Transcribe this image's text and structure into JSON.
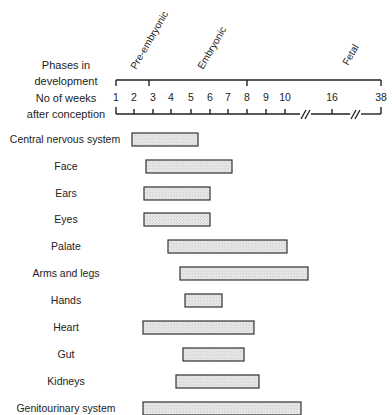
{
  "chart_data": {
    "type": "bar",
    "subtype": "gantt-timeline",
    "title": "",
    "phase_axis_label": [
      "Phases in",
      "development"
    ],
    "week_axis_label": [
      "No of weeks",
      "after conception"
    ],
    "phases": [
      {
        "name": "Pre-embryonic",
        "start": 1,
        "end": 2.8
      },
      {
        "name": "Embryonic",
        "start": 2.8,
        "end": 8
      },
      {
        "name": "Fetal",
        "start": 8,
        "end": 38
      }
    ],
    "week_ticks": [
      {
        "label": "1",
        "x": 116
      },
      {
        "label": "2",
        "x": 134
      },
      {
        "label": "3",
        "x": 153
      },
      {
        "label": "4",
        "x": 171
      },
      {
        "label": "5",
        "x": 191
      },
      {
        "label": "6",
        "x": 210
      },
      {
        "label": "7",
        "x": 228
      },
      {
        "label": "8",
        "x": 247
      },
      {
        "label": "9",
        "x": 266
      },
      {
        "label": "10",
        "x": 285
      },
      {
        "label": "16",
        "x": 332
      },
      {
        "label": "38",
        "x": 381
      }
    ],
    "axis_breaks": [
      "between 10 and 16",
      "between 16 and 38"
    ],
    "categories": [
      "Central nervous system",
      "Face",
      "Ears",
      "Eyes",
      "Palate",
      "Arms and legs",
      "Hands",
      "Heart",
      "Gut",
      "Kidneys",
      "Genitourinary system"
    ],
    "series": [
      {
        "name": "Critical period (weeks)",
        "ranges": [
          {
            "category": "Central nervous system",
            "start": 1.9,
            "end": 5.4,
            "x0": 132,
            "x1": 198,
            "y": 133
          },
          {
            "category": "Face",
            "start": 2.6,
            "end": 7.2,
            "x0": 146,
            "x1": 232,
            "y": 160
          },
          {
            "category": "Ears",
            "start": 2.5,
            "end": 6.0,
            "x0": 144,
            "x1": 210,
            "y": 187
          },
          {
            "category": "Eyes",
            "start": 2.5,
            "end": 6.0,
            "x0": 144,
            "x1": 210,
            "y": 213
          },
          {
            "category": "Palate",
            "start": 3.8,
            "end": 10.1,
            "x0": 168,
            "x1": 287,
            "y": 240
          },
          {
            "category": "Arms and legs",
            "start": 4.4,
            "end": 12.5,
            "x0": 180,
            "x1": 308,
            "y": 267
          },
          {
            "category": "Hands",
            "start": 4.7,
            "end": 6.7,
            "x0": 185,
            "x1": 222,
            "y": 294
          },
          {
            "category": "Heart",
            "start": 2.5,
            "end": 8.4,
            "x0": 143,
            "x1": 254,
            "y": 321
          },
          {
            "category": "Gut",
            "start": 4.6,
            "end": 7.9,
            "x0": 183,
            "x1": 244,
            "y": 348
          },
          {
            "category": "Kidneys",
            "start": 4.3,
            "end": 8.6,
            "x0": 176,
            "x1": 259,
            "y": 375
          },
          {
            "category": "Genitourinary system",
            "start": 2.5,
            "end": 11.5,
            "x0": 143,
            "x1": 301,
            "y": 402
          }
        ]
      }
    ],
    "colors": {
      "bar_fill": "#e6e6e6",
      "bar_stroke": "#333333",
      "axis": "#222222"
    },
    "xlabel": "No of weeks after conception",
    "ylabel": "",
    "grid": false,
    "legend": "none"
  }
}
